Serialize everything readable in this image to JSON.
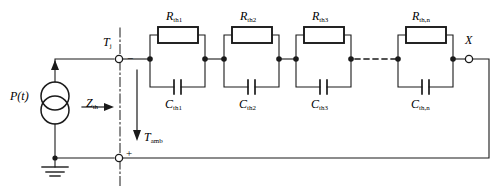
{
  "diagram": {
    "colors": {
      "wire": "#1a1a1a",
      "background": "#ffffff",
      "axis_dashdot": "#1a1a1a"
    },
    "source": {
      "label": "P(t)",
      "type": "current-source-double-circle",
      "arrow_direction": "up"
    },
    "impedance": {
      "label_base": "Z",
      "label_sub": "th",
      "arrow_direction": "right"
    },
    "terminals": {
      "junction": {
        "label_base": "T",
        "label_sub": "j",
        "polarity": "−"
      },
      "ambient": {
        "label_base": "T",
        "label_sub": "amb",
        "polarity": "+",
        "arrow_direction": "down"
      },
      "output": {
        "label": "X"
      }
    },
    "stages": [
      {
        "resistor_base": "R",
        "resistor_sub": "th1",
        "capacitor_base": "C",
        "capacitor_sub": "th1"
      },
      {
        "resistor_base": "R",
        "resistor_sub": "th2",
        "capacitor_base": "C",
        "capacitor_sub": "th2"
      },
      {
        "resistor_base": "R",
        "resistor_sub": "th3",
        "capacitor_base": "C",
        "capacitor_sub": "th3"
      },
      {
        "resistor_base": "R",
        "resistor_sub": "th,n",
        "capacitor_base": "C",
        "capacitor_sub": "th,n"
      }
    ],
    "ellipsis": "dashed-continuation",
    "ground": {
      "symbol": "earth-ground"
    }
  }
}
